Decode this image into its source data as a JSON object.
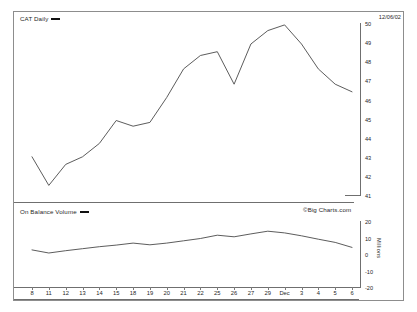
{
  "header": {
    "date_stamp": "12/06/02"
  },
  "watermark": "©Big Charts.com",
  "panels": {
    "price": {
      "legend_label": "CAT Daily",
      "y_ticks": [
        "50",
        "49",
        "48",
        "47",
        "46",
        "45",
        "44",
        "43",
        "42",
        "41"
      ]
    },
    "volume": {
      "legend_label": "On Balance Volume",
      "axis_title": "Millions",
      "y_ticks": [
        "20",
        "10",
        "0",
        "-10",
        "-20"
      ]
    }
  },
  "chart_data": [
    {
      "type": "line",
      "title": "CAT Daily",
      "xlabel": "",
      "ylabel": "",
      "ylim": [
        41,
        50
      ],
      "grid": false,
      "legend": [
        "CAT Daily"
      ],
      "legend_position": "top-left",
      "categories": [
        "8",
        "11",
        "12",
        "13",
        "14",
        "15",
        "18",
        "19",
        "20",
        "21",
        "22",
        "25",
        "26",
        "27",
        "29",
        "Dec",
        "3",
        "4",
        "5",
        "6"
      ],
      "values": [
        43.0,
        41.5,
        42.6,
        43.0,
        43.7,
        44.9,
        44.6,
        44.8,
        46.1,
        47.6,
        48.3,
        48.5,
        46.8,
        48.9,
        49.6,
        49.9,
        48.9,
        47.6,
        46.8,
        46.4
      ]
    },
    {
      "type": "line",
      "title": "On Balance Volume",
      "xlabel": "",
      "ylabel": "Millions",
      "ylim": [
        -20,
        20
      ],
      "grid": false,
      "legend": [
        "On Balance Volume"
      ],
      "legend_position": "top-left",
      "categories": [
        "8",
        "11",
        "12",
        "13",
        "14",
        "15",
        "18",
        "19",
        "20",
        "21",
        "22",
        "25",
        "26",
        "27",
        "29",
        "Dec",
        "3",
        "4",
        "5",
        "6"
      ],
      "values": [
        2.5,
        0.6,
        2.0,
        3.2,
        4.4,
        5.4,
        6.6,
        5.6,
        6.6,
        8.0,
        9.4,
        11.4,
        10.4,
        12.2,
        13.8,
        12.8,
        11.0,
        9.0,
        7.0,
        4.0
      ]
    }
  ]
}
